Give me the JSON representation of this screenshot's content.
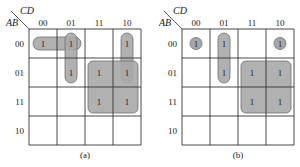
{
  "figure": {
    "maps": [
      {
        "id": "a",
        "caption": "(a)",
        "row_var": "AB",
        "col_var": "CD",
        "col_headers": [
          "00",
          "01",
          "11",
          "10"
        ],
        "row_headers": [
          "00",
          "01",
          "11",
          "10"
        ],
        "cells": [
          [
            "1",
            "1",
            "",
            "1"
          ],
          [
            "",
            "1",
            "1",
            "1"
          ],
          [
            "",
            "",
            "1",
            "1"
          ],
          [
            "",
            "",
            "",
            ""
          ]
        ],
        "groups": [
          {
            "name": "row00-cols00-01",
            "r0": 0,
            "c0": 0,
            "r1": 0,
            "c1": 1
          },
          {
            "name": "col01-rows00-01",
            "r0": 0,
            "c0": 1,
            "r1": 1,
            "c1": 1
          },
          {
            "name": "col10-rows00-01",
            "r0": 0,
            "c0": 3,
            "r1": 1,
            "c1": 3
          },
          {
            "name": "quad-rows01-11-cols11-10",
            "r0": 1,
            "c0": 2,
            "r1": 2,
            "c1": 3
          }
        ]
      },
      {
        "id": "b",
        "caption": "(b)",
        "row_var": "AB",
        "col_var": "CD",
        "col_headers": [
          "00",
          "01",
          "11",
          "10"
        ],
        "row_headers": [
          "00",
          "01",
          "11",
          "10"
        ],
        "cells": [
          [
            "1",
            "1",
            "",
            "1"
          ],
          [
            "",
            "1",
            "1",
            "1"
          ],
          [
            "",
            "",
            "1",
            "1"
          ],
          [
            "",
            "",
            "",
            ""
          ]
        ],
        "groups": [
          {
            "name": "single-r00-c00",
            "r0": 0,
            "c0": 0,
            "r1": 0,
            "c1": 0,
            "circle": true
          },
          {
            "name": "col01-rows00-01",
            "r0": 0,
            "c0": 1,
            "r1": 1,
            "c1": 1
          },
          {
            "name": "single-r00-c10",
            "r0": 0,
            "c0": 3,
            "r1": 0,
            "c1": 3,
            "circle": true
          },
          {
            "name": "quad-rows01-11-cols11-10",
            "r0": 1,
            "c0": 2,
            "r1": 2,
            "c1": 3
          }
        ]
      }
    ],
    "colors": {
      "group_fill": "#a8a8a8",
      "group_stroke": "#6e6e6e",
      "grid": "#333333",
      "text": "#222222"
    }
  }
}
